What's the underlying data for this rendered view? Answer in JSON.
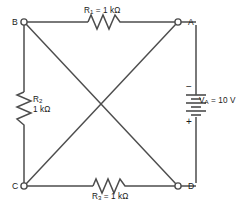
{
  "diagram": {
    "kind": "electrical-circuit-schematic",
    "shape": "square-bridge-with-diagonals",
    "stroke_color": "#4d4d4d",
    "text_color": "#1a1a1a",
    "background_color": "#ffffff"
  },
  "nodes": [
    {
      "id": "B",
      "label": "B",
      "x": 24,
      "y": 22,
      "marker": "open-circle"
    },
    {
      "id": "A",
      "label": "A",
      "x": 178,
      "y": 22,
      "marker": "open-circle"
    },
    {
      "id": "C",
      "label": "C",
      "x": 24,
      "y": 186,
      "marker": "open-circle"
    },
    {
      "id": "D",
      "label": "D",
      "x": 178,
      "y": 186,
      "marker": "open-circle"
    }
  ],
  "components": {
    "r1": {
      "designator": "R",
      "subscript": "1",
      "equals": " = ",
      "value": "1 kΩ",
      "full_label": "R1 = 1 kΩ",
      "between": "B-A",
      "orientation": "horizontal",
      "symbol": "zigzag-resistor"
    },
    "r2": {
      "designator": "R",
      "subscript": "2",
      "value": "1 kΩ",
      "full_label": "R2 1 kΩ",
      "between": "B-C",
      "orientation": "vertical",
      "symbol": "zigzag-resistor"
    },
    "r3": {
      "designator": "R",
      "subscript": "3",
      "equals": " = ",
      "value": "1 kΩ",
      "full_label": "R3 = 1 kΩ",
      "between": "C-D",
      "orientation": "horizontal",
      "symbol": "zigzag-resistor"
    },
    "source": {
      "designator": "V",
      "subscript": "A",
      "equals": " = ",
      "value": "10 V",
      "full_label": "VA = 10 V",
      "between": "A-D",
      "orientation": "vertical",
      "symbol": "battery-multicell",
      "minus_sign": "−",
      "plus_sign": "+",
      "minus_terminal": "top",
      "plus_terminal": "bottom"
    }
  },
  "wires": [
    {
      "name": "top-wire",
      "from": "B",
      "to": "A"
    },
    {
      "name": "left-wire",
      "from": "B",
      "to": "C"
    },
    {
      "name": "bottom-wire",
      "from": "C",
      "to": "D"
    },
    {
      "name": "right-wire",
      "from": "A",
      "to": "D"
    },
    {
      "name": "diagonal-b-d",
      "from": "B",
      "to": "D"
    },
    {
      "name": "diagonal-a-c",
      "from": "A",
      "to": "C"
    }
  ]
}
